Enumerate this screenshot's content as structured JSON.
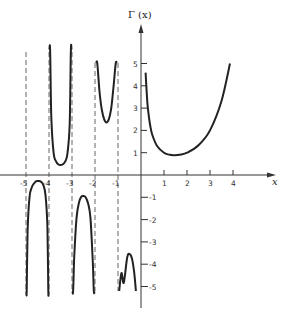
{
  "chart_data": {
    "type": "line",
    "title": "",
    "ylabel": "Γ (x)",
    "xlabel": "x",
    "xlim": [
      -5.5,
      5.8
    ],
    "ylim": [
      -5.9,
      6.8
    ],
    "grid": false,
    "legend": null,
    "x_ticks": [
      -5,
      -4,
      -3,
      -2,
      -1,
      1,
      2,
      3,
      4
    ],
    "x_tick_labels": [
      "-5",
      "-4",
      "-3",
      "-2",
      "-1",
      "1",
      "2",
      "3",
      "4"
    ],
    "y_ticks": [
      5,
      4,
      3,
      2,
      1,
      -1,
      -2,
      -3,
      -4,
      -5
    ],
    "y_tick_labels": [
      "5",
      "4",
      "3",
      "2",
      "1",
      "-1",
      "-2",
      "-3",
      "-4",
      "-5"
    ],
    "asymptotes": [
      -5,
      -4,
      -3,
      -2,
      -1
    ],
    "asymptote_style": "dashed",
    "series": [
      {
        "name": "Γ(x), 0 < x ≤ 4",
        "x": [
          0.2,
          0.25,
          0.3,
          0.4,
          0.5,
          0.7,
          1.0,
          1.25,
          1.46,
          1.75,
          2.0,
          2.5,
          3.0,
          3.5,
          3.87
        ],
        "y": [
          4.59,
          3.63,
          2.99,
          2.22,
          1.77,
          1.3,
          1.0,
          0.906,
          0.886,
          0.919,
          1.0,
          1.33,
          2.0,
          3.32,
          5.0
        ]
      },
      {
        "name": "Γ(x), -1 < x < 0",
        "x": [
          -0.95,
          -0.85,
          -0.75,
          -0.6,
          -0.5,
          -0.4,
          -0.3,
          -0.22
        ],
        "y": [
          -5.2,
          -4.4,
          -4.83,
          -3.7,
          -3.54,
          -3.72,
          -4.33,
          -5.2
        ]
      },
      {
        "name": "Γ(x), -2 < x < -1",
        "x": [
          -1.95,
          -1.9,
          -1.8,
          -1.7,
          -1.6,
          -1.5,
          -1.4,
          -1.3,
          -1.2,
          -1.1,
          -1.05
        ],
        "y": [
          5.0,
          5.0,
          3.7,
          2.9,
          2.5,
          2.36,
          2.5,
          2.95,
          3.9,
          5.0,
          5.0
        ]
      },
      {
        "name": "Γ(x), -3 < x < -2",
        "x": [
          -2.98,
          -2.95,
          -2.9,
          -2.8,
          -2.7,
          -2.6,
          -2.5,
          -2.4,
          -2.3,
          -2.2,
          -2.1,
          -2.05,
          -2.02
        ],
        "y": [
          -5.2,
          -5.2,
          -3.6,
          -1.9,
          -1.25,
          -0.98,
          -0.945,
          -1.01,
          -1.28,
          -1.9,
          -3.8,
          -5.2,
          -5.2
        ]
      },
      {
        "name": "Γ(x), -4 < x < -3",
        "x": [
          -3.985,
          -3.95,
          -3.9,
          -3.8,
          -3.7,
          -3.6,
          -3.5,
          -3.4,
          -3.3,
          -3.2,
          -3.1,
          -3.05,
          -3.02
        ],
        "y": [
          5.6,
          5.6,
          2.6,
          1.0,
          0.62,
          0.48,
          0.45,
          0.48,
          0.6,
          0.95,
          2.3,
          5.6,
          5.6
        ]
      },
      {
        "name": "Γ(x), -5 < x < -4",
        "x": [
          -4.985,
          -4.97,
          -4.93,
          -4.85,
          -4.75,
          -4.65,
          -4.55,
          -4.45,
          -4.35,
          -4.25,
          -4.15,
          -4.07,
          -4.03,
          -4.015
        ],
        "y": [
          -5.2,
          -5.2,
          -2.5,
          -1.0,
          -0.55,
          -0.38,
          -0.28,
          -0.27,
          -0.3,
          -0.45,
          -0.9,
          -2.3,
          -5.2,
          -5.2
        ]
      }
    ]
  },
  "axes": {
    "y_title": "Γ (x)",
    "x_title": "x"
  }
}
